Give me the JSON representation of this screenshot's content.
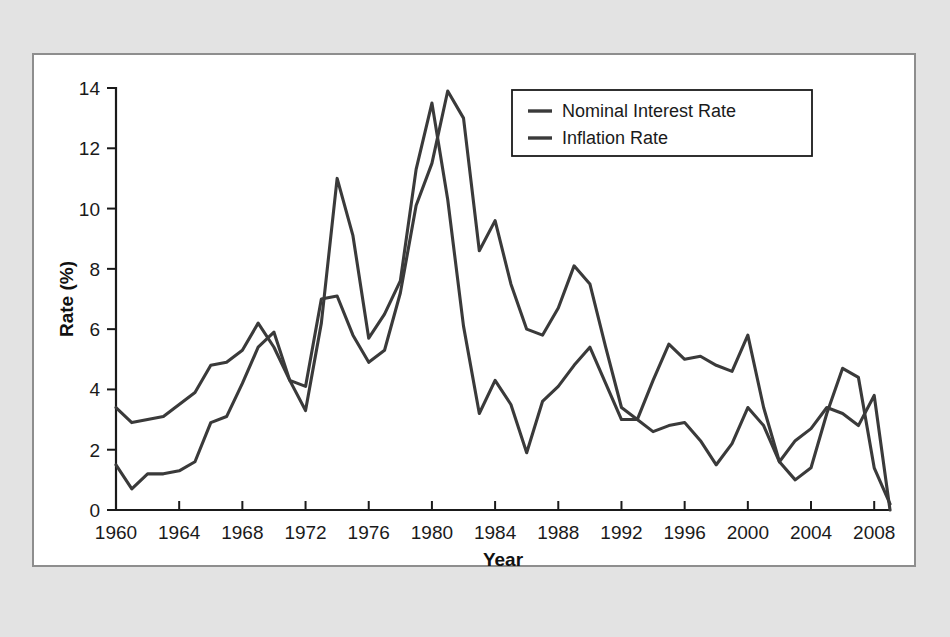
{
  "figure": {
    "panel_background": "#ffffff",
    "page_background": "#e3e3e3",
    "panel_border_color": "#8e8e8e"
  },
  "chart_data": {
    "type": "line",
    "title": "",
    "subtitle": "",
    "xlabel": "Year",
    "ylabel": "Rate (%)",
    "xlim": [
      1960,
      2009
    ],
    "ylim": [
      0,
      14
    ],
    "grid": false,
    "legend_position": "top-right",
    "x_tick_labels": [
      "1960",
      "1964",
      "1968",
      "1972",
      "1976",
      "1980",
      "1984",
      "1988",
      "1992",
      "1996",
      "2000",
      "2004",
      "2008"
    ],
    "x_ticks": [
      1960,
      1964,
      1968,
      1972,
      1976,
      1980,
      1984,
      1988,
      1992,
      1996,
      2000,
      2004,
      2008
    ],
    "y_tick_labels": [
      "0",
      "2",
      "4",
      "6",
      "8",
      "10",
      "12",
      "14"
    ],
    "y_ticks": [
      0,
      2,
      4,
      6,
      8,
      10,
      12,
      14
    ],
    "x": [
      1960,
      1961,
      1962,
      1963,
      1964,
      1965,
      1966,
      1967,
      1968,
      1969,
      1970,
      1971,
      1972,
      1973,
      1974,
      1975,
      1976,
      1977,
      1978,
      1979,
      1980,
      1981,
      1982,
      1983,
      1984,
      1985,
      1986,
      1987,
      1988,
      1989,
      1990,
      1991,
      1992,
      1993,
      1994,
      1995,
      1996,
      1997,
      1998,
      1999,
      2000,
      2001,
      2002,
      2003,
      2004,
      2005,
      2006,
      2007,
      2008,
      2009
    ],
    "series": [
      {
        "name": "Nominal Interest Rate",
        "color": "#3a3a3a",
        "values": [
          3.4,
          2.9,
          3.0,
          3.1,
          3.5,
          3.9,
          4.8,
          4.9,
          5.3,
          6.2,
          5.4,
          4.3,
          4.1,
          7.0,
          7.1,
          5.8,
          4.9,
          5.3,
          7.2,
          10.1,
          11.5,
          13.9,
          13.0,
          8.6,
          9.6,
          7.5,
          6.0,
          5.8,
          6.7,
          8.1,
          7.5,
          5.4,
          3.4,
          3.0,
          4.3,
          5.5,
          5.0,
          5.1,
          4.8,
          4.6,
          5.8,
          3.4,
          1.6,
          1.0,
          1.4,
          3.2,
          4.7,
          4.4,
          1.4,
          0.2
        ]
      },
      {
        "name": "Inflation Rate",
        "color": "#3a3a3a",
        "values": [
          1.5,
          0.7,
          1.2,
          1.2,
          1.3,
          1.6,
          2.9,
          3.1,
          4.2,
          5.4,
          5.9,
          4.3,
          3.3,
          6.2,
          11.0,
          9.1,
          5.7,
          6.5,
          7.6,
          11.3,
          13.5,
          10.3,
          6.1,
          3.2,
          4.3,
          3.5,
          1.9,
          3.6,
          4.1,
          4.8,
          5.4,
          4.2,
          3.0,
          3.0,
          2.6,
          2.8,
          2.9,
          2.3,
          1.5,
          2.2,
          3.4,
          2.8,
          1.6,
          2.3,
          2.7,
          3.4,
          3.2,
          2.8,
          3.8,
          0.0
        ]
      }
    ]
  },
  "legend": {
    "entries": [
      {
        "label": "Nominal Interest Rate"
      },
      {
        "label": "Inflation Rate"
      }
    ]
  },
  "axes": {
    "x_title": "Year",
    "y_title": "Rate (%)"
  }
}
